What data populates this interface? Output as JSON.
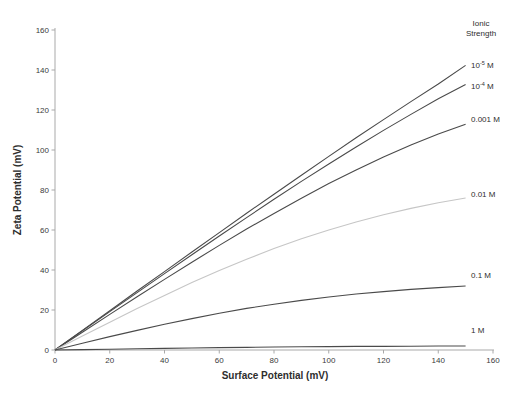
{
  "colors": {
    "background": "#ffffff",
    "axis": "#a9a9a9",
    "tick_text": "#3b3b3b",
    "label_text": "#2e2e2e",
    "line_dark": "#4a4a4a",
    "line_faint": "#c6c6c6"
  },
  "chart_data": {
    "type": "line",
    "title": "",
    "xlabel": "Surface Potential (mV)",
    "ylabel": "Zeta Potential (mV)",
    "legend_title": "Ionic\nStrength",
    "legend_position": "right-outside",
    "grid": false,
    "xlim": [
      0,
      160
    ],
    "ylim": [
      0,
      160
    ],
    "x_ticks": [
      0,
      20,
      40,
      60,
      80,
      100,
      120,
      140,
      160
    ],
    "y_ticks": [
      0,
      20,
      40,
      60,
      80,
      100,
      120,
      140,
      160
    ],
    "x": [
      0,
      10,
      20,
      30,
      40,
      50,
      60,
      70,
      80,
      90,
      100,
      110,
      120,
      130,
      140,
      150
    ],
    "series": [
      {
        "name": "10^-5 M",
        "label": "10^{-5} M",
        "color": "#4a4a4a",
        "values": [
          0,
          9.8,
          19.6,
          29.5,
          39.2,
          49.0,
          58.7,
          68.4,
          77.9,
          87.4,
          96.8,
          106.1,
          115.2,
          124.2,
          133.0,
          142.3
        ]
      },
      {
        "name": "10^-4 M",
        "label": "10^{-4} M",
        "color": "#4a4a4a",
        "values": [
          0,
          9.6,
          19.2,
          28.7,
          38.2,
          47.6,
          57.0,
          66.2,
          75.4,
          84.3,
          93.0,
          101.5,
          109.8,
          117.8,
          125.6,
          132.7
        ]
      },
      {
        "name": "0.001 M",
        "label": "0.001 M",
        "color": "#4a4a4a",
        "values": [
          0,
          8.9,
          17.8,
          26.6,
          35.3,
          43.9,
          52.3,
          60.5,
          68.3,
          75.9,
          83.2,
          90.0,
          96.5,
          102.5,
          108.0,
          112.9
        ]
      },
      {
        "name": "0.01 M",
        "label": "0.01 M",
        "color": "#c6c6c6",
        "values": [
          0,
          7.0,
          13.9,
          20.7,
          27.3,
          33.7,
          39.7,
          45.4,
          50.7,
          55.6,
          60.0,
          64.0,
          67.6,
          70.8,
          73.6,
          76.0
        ]
      },
      {
        "name": "0.1 M",
        "label": "0.1 M",
        "color": "#4a4a4a",
        "values": [
          0,
          3.4,
          6.7,
          9.8,
          12.9,
          15.7,
          18.4,
          20.8,
          22.9,
          24.8,
          26.5,
          28.0,
          29.2,
          30.3,
          31.2,
          32.0
        ]
      },
      {
        "name": "1 M",
        "label": "1 M",
        "color": "#4a4a4a",
        "values": [
          0,
          0.2,
          0.4,
          0.6,
          0.8,
          1.0,
          1.2,
          1.3,
          1.5,
          1.6,
          1.7,
          1.8,
          1.8,
          1.9,
          2.0,
          2.0
        ]
      }
    ]
  }
}
